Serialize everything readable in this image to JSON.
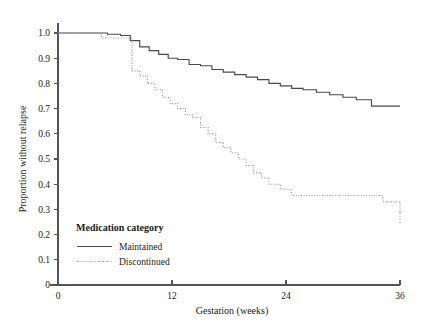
{
  "chart_data": {
    "type": "line",
    "title": "",
    "subtitle": "",
    "xlabel": "Gestation (weeks)",
    "ylabel": "Proportion without relapse",
    "xlim": [
      0,
      36
    ],
    "ylim": [
      0,
      1.0
    ],
    "xticks": [
      0,
      12,
      24,
      36
    ],
    "xtick_labels": [
      "0",
      "12",
      "24",
      "36"
    ],
    "yticks": [
      0,
      0.1,
      0.2,
      0.3,
      0.4,
      0.5,
      0.6,
      0.7,
      0.8,
      0.9,
      1.0
    ],
    "ytick_labels": [
      "0",
      "0.1",
      "0.2",
      "0.3",
      "0.4",
      "0.5",
      "0.6",
      "0.7",
      "0.8",
      "0.9",
      "1.0"
    ],
    "grid": false,
    "legend_position": "bottom-left",
    "legend_title": "Medication category",
    "series": [
      {
        "name": "Maintained",
        "style": "solid",
        "color": "#4a4a4a",
        "x": [
          0,
          4.0,
          5.2,
          6.6,
          7.6,
          8.6,
          9.6,
          10.6,
          11.6,
          12.6,
          13.8,
          15.0,
          16.2,
          17.4,
          18.6,
          19.8,
          21.0,
          22.2,
          23.4,
          24.6,
          25.8,
          27.2,
          28.6,
          30.0,
          31.4,
          33.0,
          36.0
        ],
        "y": [
          1.0,
          1.0,
          0.995,
          0.99,
          0.97,
          0.945,
          0.93,
          0.915,
          0.9,
          0.895,
          0.875,
          0.87,
          0.855,
          0.845,
          0.835,
          0.825,
          0.815,
          0.8,
          0.79,
          0.78,
          0.775,
          0.765,
          0.755,
          0.745,
          0.735,
          0.71,
          0.71
        ]
      },
      {
        "name": "Discontinued",
        "style": "dotted",
        "color": "#9a9a9a",
        "x": [
          0,
          3.6,
          4.6,
          7.0,
          7.8,
          8.6,
          9.4,
          10.2,
          11.0,
          11.8,
          12.6,
          13.4,
          14.2,
          15.0,
          15.8,
          16.6,
          17.4,
          18.2,
          19.0,
          19.8,
          20.6,
          21.4,
          22.2,
          23.4,
          24.6,
          32.6,
          34.2,
          36.0
        ],
        "y": [
          1.0,
          1.0,
          0.98,
          0.98,
          0.85,
          0.83,
          0.8,
          0.775,
          0.745,
          0.72,
          0.7,
          0.675,
          0.665,
          0.625,
          0.6,
          0.565,
          0.545,
          0.525,
          0.5,
          0.475,
          0.445,
          0.425,
          0.4,
          0.38,
          0.355,
          0.355,
          0.33,
          0.245
        ]
      }
    ]
  },
  "legend": {
    "title": "Medication category",
    "entries": [
      {
        "label": "Maintained",
        "style": "solid"
      },
      {
        "label": "Discontinued",
        "style": "dotted"
      }
    ]
  },
  "axes": {
    "y_title": "Proportion without relapse",
    "x_title": "Gestation (weeks)"
  }
}
